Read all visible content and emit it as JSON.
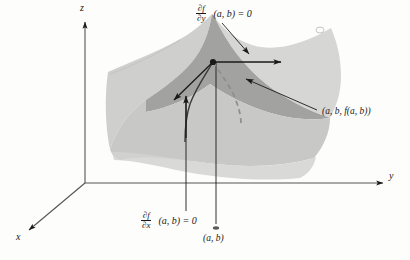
{
  "figure": {
    "background_color": "#fdfdfc",
    "line_color": "#1a1a1a"
  },
  "axes": {
    "origin": {
      "x": 85,
      "y": 183
    },
    "x_axis": {
      "label": "x",
      "label_x": 18,
      "label_y": 239,
      "tip_x": 26,
      "tip_y": 232
    },
    "y_axis": {
      "label": "y",
      "label_x": 391,
      "label_y": 178,
      "tip_x": 386,
      "tip_y": 183
    },
    "z_axis": {
      "label": "z",
      "label_x": 82,
      "label_y": 8,
      "tip_x": 85,
      "tip_y": 18
    }
  },
  "surface": {
    "type": "saddle",
    "fill_light": "#cfcfcd",
    "fill_mid": "#bcbcba",
    "fill_dark": "#a2a2a0",
    "fill_shadow": "#c8c8c6"
  },
  "critical_point": {
    "name": "saddle-point",
    "x": 213,
    "y": 62,
    "label": "(a, b, f(a, b))",
    "label_x": 322,
    "label_y": 113
  },
  "base_point": {
    "name": "base-point",
    "x": 216,
    "y": 228,
    "label": "(a, b)",
    "label_x": 205,
    "label_y": 240
  },
  "annotations": {
    "partial_y": {
      "numerator": "∂f",
      "denominator": "∂y",
      "tail": "(a, b) = 0",
      "label_x": 196,
      "label_y": 8
    },
    "partial_x": {
      "numerator": "∂f",
      "denominator": "∂x",
      "tail": "(a, b) = 0",
      "label_x": 141,
      "label_y": 215
    }
  },
  "tangent_vectors": [
    {
      "name": "tangent-vector-y",
      "from_x": 213,
      "from_y": 62,
      "to_x": 283,
      "to_y": 62
    },
    {
      "name": "tangent-vector-x",
      "from_x": 213,
      "from_y": 62,
      "to_x": 172,
      "to_y": 101
    }
  ],
  "leader_lines": [
    {
      "name": "leader-partial-y",
      "from_x": 222,
      "from_y": 22,
      "to_x": 250,
      "to_y": 56
    },
    {
      "name": "leader-point-label",
      "from_x": 318,
      "from_y": 110,
      "to_x": 243,
      "to_y": 78
    },
    {
      "name": "leader-partial-x-left",
      "from_x": 186,
      "from_y": 211,
      "to_x": 186,
      "to_y": 100
    },
    {
      "name": "leader-base-point",
      "from_x": 216,
      "from_y": 224,
      "to_x": 216,
      "to_y": 62
    }
  ]
}
